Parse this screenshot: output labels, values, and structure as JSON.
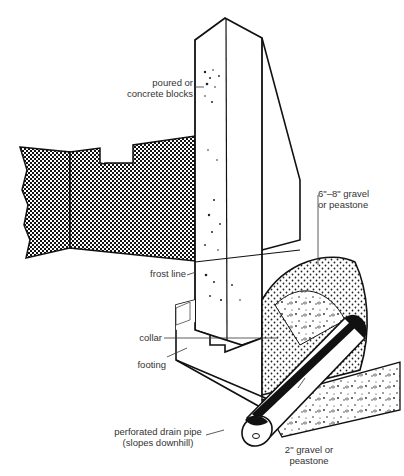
{
  "diagram": {
    "labels": {
      "wall": [
        "poured or",
        "concrete blocks"
      ],
      "frost_line": "frost line",
      "collar": "collar",
      "footing": "footing",
      "drain_pipe": [
        "perforated drain pipe",
        "(slopes downhill)"
      ],
      "gravel_upper": [
        "6\"–8\" gravel",
        "or peastone"
      ],
      "gravel_lower": [
        "2\" gravel or",
        "peastone"
      ]
    },
    "colors": {
      "ink": "#1a1a1a",
      "label": "#333333",
      "background": "#ffffff"
    }
  }
}
